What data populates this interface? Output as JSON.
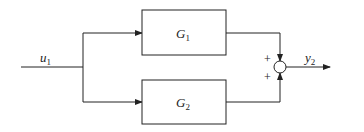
{
  "diagram": {
    "type": "block-diagram-parallel",
    "input": {
      "name": "u",
      "sub": "1"
    },
    "output": {
      "name": "y",
      "sub": "2"
    },
    "blocks": [
      {
        "name": "G",
        "sub": "1"
      },
      {
        "name": "G",
        "sub": "2"
      }
    ],
    "summing_junction": {
      "signs": [
        "+",
        "+"
      ]
    },
    "colors": {
      "line": "#222222",
      "background": "#ffffff"
    }
  }
}
